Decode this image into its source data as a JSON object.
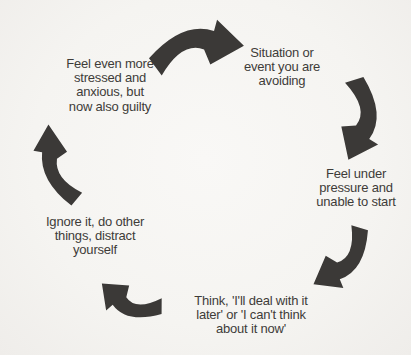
{
  "diagram": {
    "type": "cycle",
    "colors": {
      "background": "#f6f5f2",
      "arrow": "#3b3937",
      "text": "#3e3c39"
    },
    "stages": [
      {
        "id": 1,
        "position": "top-right",
        "label": "Situation or\nevent you are\navoiding"
      },
      {
        "id": 2,
        "position": "right",
        "label": "Feel under\npressure and\nunable to start"
      },
      {
        "id": 3,
        "position": "bottom",
        "label": "Think, 'I'll deal with it\nlater' or 'I can't think\nabout it now'"
      },
      {
        "id": 4,
        "position": "left",
        "label": "Ignore it, do other\nthings, distract\nyourself"
      },
      {
        "id": 5,
        "position": "top-left",
        "label": "Feel even more\nstressed and\nanxious, but\nnow also guilty"
      }
    ],
    "arrows": [
      {
        "name": "top",
        "from": 5,
        "to": 1
      },
      {
        "name": "right-upper",
        "from": 1,
        "to": 2
      },
      {
        "name": "right-lower",
        "from": 2,
        "to": 3
      },
      {
        "name": "bottom-left",
        "from": 3,
        "to": 4
      },
      {
        "name": "left",
        "from": 4,
        "to": 5
      }
    ]
  }
}
